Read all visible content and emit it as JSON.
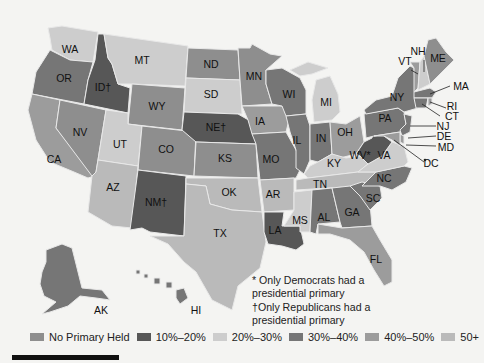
{
  "legend": [
    {
      "key": "none",
      "label": "No Primary Held",
      "color": "#8e8e8e"
    },
    {
      "key": "p10",
      "label": "10%–20%",
      "color": "#575757"
    },
    {
      "key": "p20",
      "label": "20%–30%",
      "color": "#cdcdcd"
    },
    {
      "key": "p30",
      "label": "30%–40%",
      "color": "#767676"
    },
    {
      "key": "p40",
      "label": "40%–50%",
      "color": "#9c9c9c"
    },
    {
      "key": "p50",
      "label": "50+",
      "color": "#bababa"
    }
  ],
  "footnotes": {
    "line1": "* Only Democrats had a",
    "line2": "presidential primary",
    "line3": "†Only Republicans had a",
    "line4": "presidential primary"
  },
  "states": {
    "WA": {
      "label": "WA",
      "category": "p20"
    },
    "OR": {
      "label": "OR",
      "category": "p30"
    },
    "CA": {
      "label": "CA",
      "category": "p40"
    },
    "ID": {
      "label": "ID†",
      "category": "p10"
    },
    "NV": {
      "label": "NV",
      "category": "none"
    },
    "MT": {
      "label": "MT",
      "category": "p20"
    },
    "WY": {
      "label": "WY",
      "category": "none"
    },
    "UT": {
      "label": "UT",
      "category": "p20"
    },
    "AZ": {
      "label": "AZ",
      "category": "p50"
    },
    "CO": {
      "label": "CO",
      "category": "none"
    },
    "NM": {
      "label": "NM†",
      "category": "p10"
    },
    "ND": {
      "label": "ND",
      "category": "none"
    },
    "SD": {
      "label": "SD",
      "category": "p20"
    },
    "NE": {
      "label": "NE†",
      "category": "p10"
    },
    "KS": {
      "label": "KS",
      "category": "none"
    },
    "OK": {
      "label": "OK",
      "category": "p50"
    },
    "TX": {
      "label": "TX",
      "category": "p50"
    },
    "MN": {
      "label": "MN",
      "category": "none"
    },
    "IA": {
      "label": "IA",
      "category": "p40"
    },
    "MO": {
      "label": "MO",
      "category": "p30"
    },
    "AR": {
      "label": "AR",
      "category": "p50"
    },
    "LA": {
      "label": "LA",
      "category": "p10"
    },
    "WI": {
      "label": "WI",
      "category": "p30"
    },
    "IL": {
      "label": "IL",
      "category": "p30"
    },
    "MI": {
      "label": "MI",
      "category": "p20"
    },
    "IN": {
      "label": "IN",
      "category": "p30"
    },
    "OH": {
      "label": "OH",
      "category": "p40"
    },
    "KY": {
      "label": "KY",
      "category": "p20"
    },
    "TN": {
      "label": "TN",
      "category": "p50"
    },
    "MS": {
      "label": "MS",
      "category": "p20"
    },
    "AL": {
      "label": "AL",
      "category": "p30"
    },
    "GA": {
      "label": "GA",
      "category": "p30"
    },
    "FL": {
      "label": "FL",
      "category": "p40"
    },
    "SC": {
      "label": "SC",
      "category": "p30"
    },
    "NC": {
      "label": "NC",
      "category": "p30"
    },
    "VA": {
      "label": "VA",
      "category": "p20"
    },
    "WV": {
      "label": "WV*",
      "category": "p10"
    },
    "PA": {
      "label": "PA",
      "category": "p30"
    },
    "NY": {
      "label": "NY",
      "category": "p30"
    },
    "VT": {
      "label": "VT",
      "category": "p40"
    },
    "NH": {
      "label": "NH",
      "category": "p20"
    },
    "ME": {
      "label": "ME",
      "category": "none"
    },
    "MA": {
      "label": "MA",
      "category": "p30"
    },
    "RI": {
      "label": "RI",
      "category": "p40"
    },
    "CT": {
      "label": "CT",
      "category": "p30"
    },
    "NJ": {
      "label": "NJ",
      "category": "p30"
    },
    "DE": {
      "label": "DE",
      "category": "p40"
    },
    "MD": {
      "label": "MD",
      "category": "p40"
    },
    "DC": {
      "label": "DC",
      "category": "p20"
    },
    "AK": {
      "label": "AK",
      "category": "p30"
    },
    "HI": {
      "label": "HI",
      "category": "p30"
    }
  }
}
